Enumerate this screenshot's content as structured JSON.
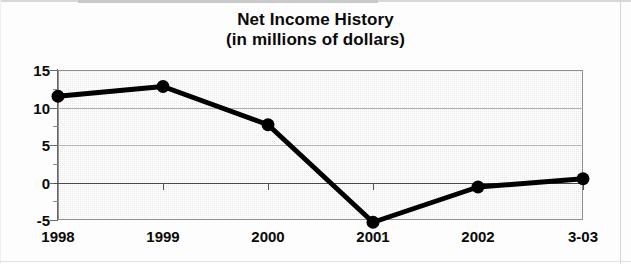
{
  "chart_data": {
    "type": "line",
    "title": "Net Income History",
    "subtitle": "(in millions of dollars)",
    "xlabel": "",
    "ylabel": "",
    "categories": [
      "1998",
      "1999",
      "2000",
      "2001",
      "2002",
      "3-03"
    ],
    "values": [
      11.5,
      12.8,
      7.7,
      -5.3,
      -0.6,
      0.5
    ],
    "series": [
      {
        "name": "Net Income",
        "values": [
          11.5,
          12.8,
          7.7,
          -5.3,
          -0.6,
          0.5
        ]
      }
    ],
    "ylim": [
      -5,
      15
    ],
    "yticks": [
      15,
      10,
      5,
      0,
      -5
    ],
    "ytick_labels": [
      "15",
      "10",
      "5",
      "0",
      "-5"
    ],
    "yminor_ticks": [
      12.5,
      7.5,
      2.5,
      -2.5
    ],
    "grid": true,
    "grid_axis": "y",
    "legend": false,
    "legend_position": "none",
    "zero_line": 0,
    "line_color": "#000000",
    "marker": "circle",
    "marker_color": "#000000",
    "plot_background": "#e9e9e9",
    "plot_border_color": "#8f8f8f",
    "text_color": "#0a0a0a"
  }
}
